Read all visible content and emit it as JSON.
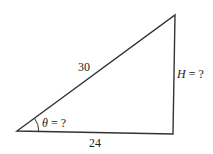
{
  "diagram": {
    "type": "right-triangle",
    "hypotenuse_label": "30",
    "base_label": "24",
    "height_var": "H",
    "height_rest": " = ?",
    "angle_var": "θ",
    "angle_rest": " = ?",
    "stroke_color": "#333333"
  }
}
